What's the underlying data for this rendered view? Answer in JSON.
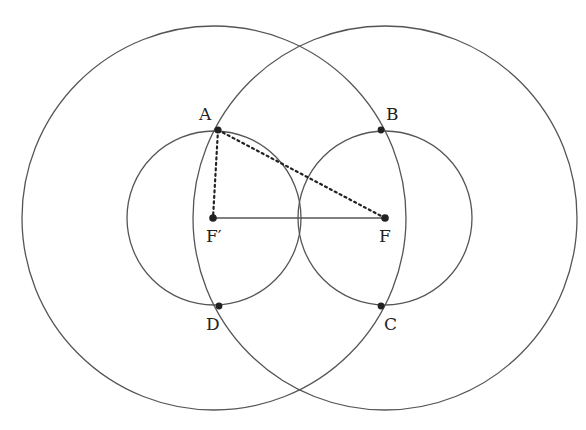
{
  "diagram": {
    "colors": {
      "stroke": "#555555",
      "point": "#222222",
      "text": "#222222"
    },
    "large_circles": [
      {
        "name": "large-circle-left",
        "cx": 214,
        "cy": 218,
        "r": 192
      },
      {
        "name": "large-circle-right",
        "cx": 385,
        "cy": 218,
        "r": 192
      }
    ],
    "small_circles": [
      {
        "name": "small-circle-left",
        "cx": 214,
        "cy": 218,
        "r": 87
      },
      {
        "name": "small-circle-right",
        "cx": 385,
        "cy": 218,
        "r": 87
      }
    ],
    "points": {
      "A": {
        "label": "A",
        "x": 218,
        "y": 130
      },
      "B": {
        "label": "B",
        "x": 381,
        "y": 130
      },
      "C": {
        "label": "C",
        "x": 381,
        "y": 306
      },
      "D": {
        "label": "D",
        "x": 219,
        "y": 306
      },
      "Fp": {
        "label": "F′",
        "x": 213,
        "y": 218
      },
      "F": {
        "label": "F",
        "x": 385,
        "y": 218
      }
    },
    "segments": {
      "solid": [
        {
          "from": "Fp",
          "to": "F"
        }
      ],
      "dotted": [
        {
          "from": "A",
          "to": "Fp"
        },
        {
          "from": "A",
          "to": "F"
        }
      ]
    }
  }
}
